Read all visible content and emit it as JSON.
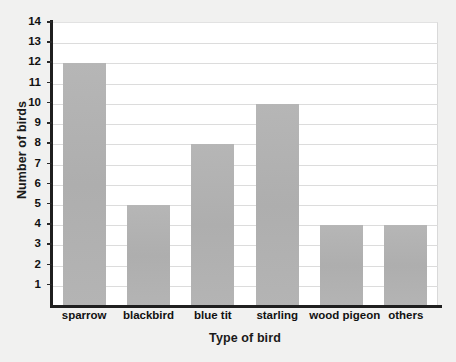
{
  "chart_data": {
    "type": "bar",
    "title": "",
    "xlabel": "Type of bird",
    "ylabel": "Number of birds",
    "categories": [
      "sparrow",
      "blackbird",
      "blue tit",
      "starling",
      "wood pigeon",
      "others"
    ],
    "values": [
      12,
      5,
      8,
      10,
      4,
      4
    ],
    "ylim": [
      0,
      14
    ],
    "ytick_labels": [
      "14",
      "13",
      "12",
      "11",
      "10",
      "9",
      "8",
      "7",
      "6",
      "5",
      "4",
      "3",
      "2",
      "1"
    ],
    "ytick_values": [
      14,
      13,
      12,
      11,
      10,
      9,
      8,
      7,
      6,
      5,
      4,
      3,
      2,
      1
    ],
    "grid": "horizontal",
    "legend": "none",
    "series": [
      {
        "name": "Number of birds",
        "values": [
          12,
          5,
          8,
          10,
          4,
          4
        ]
      }
    ],
    "colors": {
      "bar_fill": "#b3b3b3",
      "gridline": "#dcdcdc",
      "axis": "#1f1f1f",
      "plot_background": "#ffffff",
      "page_background": "#f1f1f0",
      "text": "#111111"
    }
  },
  "axes": {
    "y_title": "Number of birds",
    "x_title": "Type of bird"
  }
}
